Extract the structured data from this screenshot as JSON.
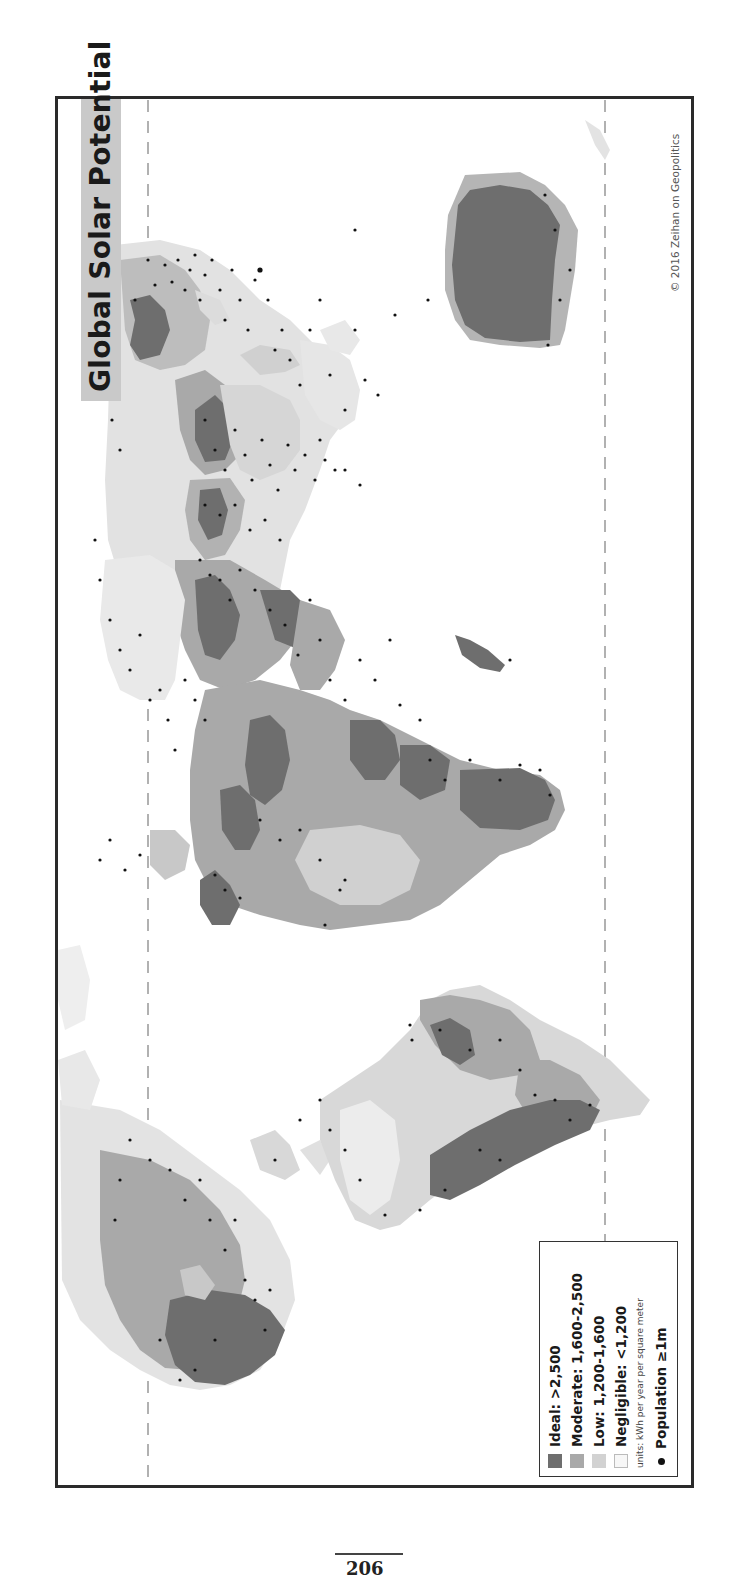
{
  "map": {
    "title": "Global Solar Potential",
    "copyright": "© 2016 Zeihan on Geopolitics",
    "orientation": "rotated 90° (landscape map printed on portrait page)",
    "colors": {
      "ideal": "#6e6e6e",
      "moderate": "#a9a9a9",
      "low": "#d2d2d2",
      "negligible": "#f4f4f4",
      "population_dot": "#111111",
      "title_bg": "#c9c9c9",
      "frame": "#2a2a2a"
    },
    "legend": {
      "items": [
        {
          "label": "Ideal: >2,500",
          "color": "#6e6e6e"
        },
        {
          "label": "Moderate: 1,600-2,500",
          "color": "#a9a9a9"
        },
        {
          "label": "Low: 1,200-1,600",
          "color": "#d2d2d2"
        },
        {
          "label": "Negligible: <1,200",
          "color": "#f7f7f7"
        }
      ],
      "units": "units: kWh per year per square meter",
      "population": "Population ≥1m"
    },
    "reference_lines": [
      "dashed line (northern latitude)",
      "dashed line (southern latitude)"
    ]
  },
  "page": {
    "number": "206"
  }
}
